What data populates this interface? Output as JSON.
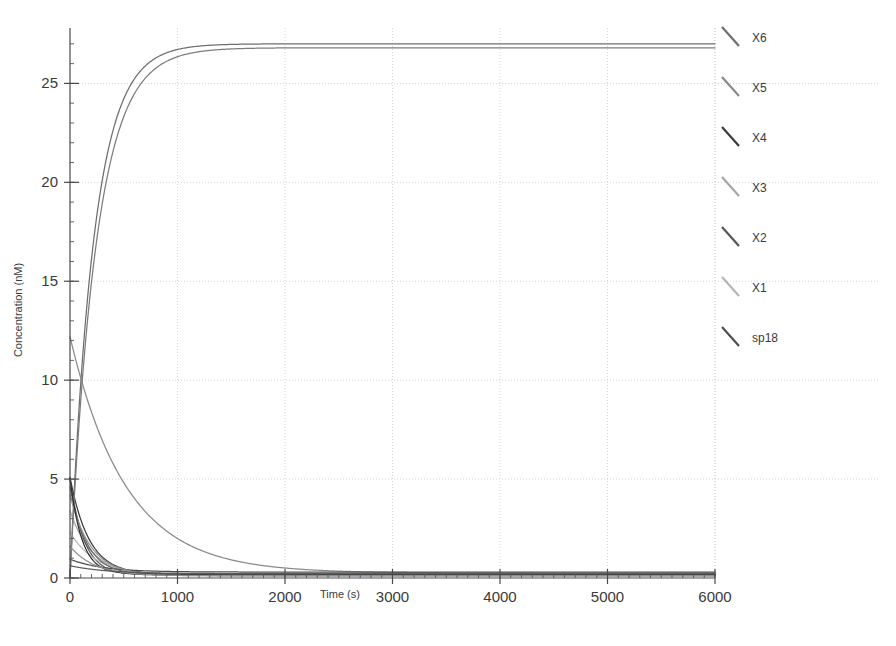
{
  "chart_data": {
    "type": "line",
    "title": "",
    "xlabel": "Time (s)",
    "ylabel": "Concentration (nM)",
    "xlim": [
      0,
      6000
    ],
    "ylim": [
      0,
      27.8
    ],
    "xticks": [
      0,
      1000,
      2000,
      3000,
      4000,
      5000,
      6000
    ],
    "xtick_labels": [
      "0",
      "1000",
      "2000",
      "3000",
      "4000",
      "5000",
      "6000"
    ],
    "yticks": [
      0,
      5,
      10,
      15,
      20,
      25
    ],
    "ytick_labels": [
      "0",
      "5",
      "10",
      "15",
      "20",
      "25"
    ],
    "xtick_minor_step": 100,
    "ytick_minor_step": 1,
    "grid": true,
    "grid_color": "#cccccc",
    "legend_position": "right-outside",
    "background": "#ffffff",
    "axis_color": "#4a4a4a",
    "series": [
      {
        "name": "X6",
        "color": "#6e6e6e",
        "model": "rise",
        "y0": 0.0,
        "yinf": 27.0,
        "tau": 220,
        "note": "saturating rise to plateau ~27 nM"
      },
      {
        "name": "X5",
        "color": "#8a8a8a",
        "model": "decay",
        "y0": 12.2,
        "yinf": 0.25,
        "tau": 520,
        "note": "slow light-gray decay from ~12 nM"
      },
      {
        "name": "X4",
        "color": "#3b3b3b",
        "model": "decay",
        "y0": 5.1,
        "yinf": 0.18,
        "tau": 175,
        "note": "dark decay from ~5 nM"
      },
      {
        "name": "X3",
        "color": "#a6a6a6",
        "model": "decay",
        "y0": 3.4,
        "yinf": 0.12,
        "tau": 205,
        "note": "light decay from ~3.4 nM"
      },
      {
        "name": "X2",
        "color": "#555555",
        "model": "decay",
        "y0": 5.0,
        "yinf": 0.15,
        "tau": 130,
        "note": "medium-dark fast decay from ~5 nM"
      },
      {
        "name": "X1",
        "color": "#b5b5b5",
        "model": "decay",
        "y0": 2.3,
        "yinf": 0.1,
        "tau": 250,
        "note": "lightest decay from ~2.3 nM"
      },
      {
        "name": "sp18",
        "color": "#4f4f4f",
        "model": "decay",
        "y0": 0.95,
        "yinf": 0.3,
        "tau": 300,
        "note": "low dark decay from ~1 nM"
      },
      {
        "name": "extra-rise",
        "color": "#7c7c7c",
        "model": "rise",
        "y0": 0.0,
        "yinf": 26.8,
        "tau": 245,
        "legend": false,
        "note": "second overlapping rising trace"
      },
      {
        "name": "extra-decay-a",
        "color": "#666666",
        "model": "decay",
        "y0": 4.6,
        "yinf": 0.16,
        "tau": 155,
        "legend": false,
        "note": "overlapping mid decay"
      },
      {
        "name": "extra-decay-b",
        "color": "#949494",
        "model": "decay",
        "y0": 4.2,
        "yinf": 0.14,
        "tau": 190,
        "legend": false,
        "note": "overlapping mid decay"
      },
      {
        "name": "extra-decay-c",
        "color": "#2f2f2f",
        "model": "decay",
        "y0": 5.05,
        "yinf": 0.2,
        "tau": 110,
        "legend": false,
        "note": "overlapping fast dark decay"
      },
      {
        "name": "extra-decay-d",
        "color": "#8f8f8f",
        "model": "decay",
        "y0": 1.6,
        "yinf": 0.11,
        "tau": 230,
        "legend": false,
        "note": "overlapping low decay"
      },
      {
        "name": "extra-decay-e",
        "color": "#5c5c5c",
        "model": "decay",
        "y0": 0.62,
        "yinf": 0.22,
        "tau": 340,
        "legend": false,
        "note": "lowest overlapping decay"
      }
    ]
  },
  "legend": {
    "items": [
      {
        "label": "X6",
        "color": "#6e6e6e",
        "weight": 2.4
      },
      {
        "label": "X5",
        "color": "#8a8a8a",
        "weight": 2.2
      },
      {
        "label": "X4",
        "color": "#3b3b3b",
        "weight": 2.8
      },
      {
        "label": "X3",
        "color": "#a6a6a6",
        "weight": 1.6
      },
      {
        "label": "X2",
        "color": "#555555",
        "weight": 2.4
      },
      {
        "label": "X1",
        "color": "#b5b5b5",
        "weight": 1.5
      },
      {
        "label": "sp18",
        "color": "#4f4f4f",
        "weight": 2.2
      }
    ]
  },
  "plot_geometry": {
    "left": 70,
    "right": 715,
    "top": 28,
    "bottom": 578,
    "legend_x_line": 722,
    "legend_x_label": 752,
    "legend_y_start": 38,
    "legend_y_step": 50
  }
}
